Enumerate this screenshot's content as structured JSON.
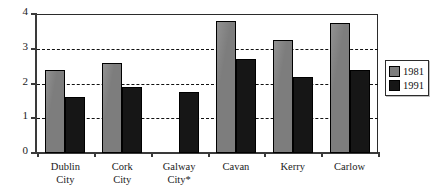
{
  "chart_data": {
    "type": "bar",
    "title": "",
    "subtitle": "",
    "xlabel": "",
    "ylabel": "",
    "ylim": [
      0,
      4
    ],
    "yticks": [
      "0",
      "1",
      "2",
      "3",
      "4"
    ],
    "gridlines": [
      1,
      2,
      3
    ],
    "grid": "horizontal-dashed",
    "legend_position": "right",
    "categories": [
      "Dublin City",
      "Cork City",
      "Galway City*",
      "Cavan",
      "Kerry",
      "Carlow"
    ],
    "category_lines": [
      [
        "Dublin",
        "City"
      ],
      [
        "Cork",
        "City"
      ],
      [
        "Galway",
        "City*"
      ],
      [
        "Cavan",
        ""
      ],
      [
        "Kerry",
        ""
      ],
      [
        "Carlow",
        ""
      ]
    ],
    "series": [
      {
        "name": "1981",
        "color": "#7d7d7d",
        "values": [
          2.4,
          2.6,
          null,
          3.8,
          3.25,
          3.75
        ]
      },
      {
        "name": "1991",
        "color": "#161616",
        "values": [
          1.6,
          1.9,
          1.75,
          2.7,
          2.2,
          2.4
        ]
      }
    ]
  },
  "legend": {
    "items": [
      {
        "label": "1981",
        "color": "#7d7d7d"
      },
      {
        "label": "1991",
        "color": "#161616"
      }
    ]
  }
}
